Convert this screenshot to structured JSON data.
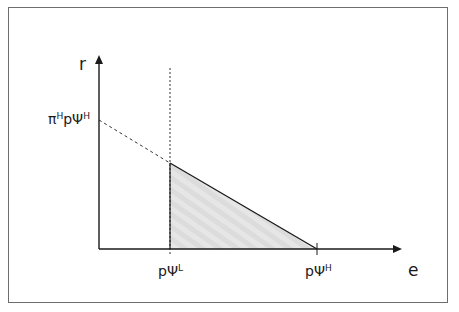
{
  "diagram": {
    "type": "economic-graph",
    "axes": {
      "y_label": "r",
      "x_label": "e"
    },
    "y_intercept_label": {
      "main": "π",
      "sup1": "H",
      "mid": "pΨ",
      "sup2": "H"
    },
    "x_tick_labels": [
      {
        "main": "pΨ",
        "sup": "L"
      },
      {
        "main": "pΨ",
        "sup": "H"
      }
    ],
    "elements": [
      "dashed line from y-intercept π^H pΨ^H descending to vertical dashed line at pΨ^L",
      "solid line from that point descending to x-axis at pΨ^H",
      "vertical dashed line at pΨ^L",
      "shaded triangle between pΨ^L, pΨ^H and the downward sloping line"
    ],
    "colors": {
      "line": "#1a1a1a",
      "frame": "#6e6e6e",
      "fill": "#e2e2e2"
    }
  }
}
